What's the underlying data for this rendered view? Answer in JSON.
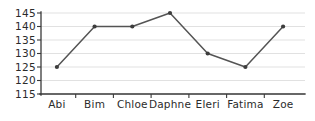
{
  "chart_data": {
    "type": "line",
    "title": "",
    "subtitle": "",
    "xlabel": "",
    "ylabel": "",
    "categories": [
      "Abi",
      "Bim",
      "Chloe",
      "Daphne",
      "Eleri",
      "Fatima",
      "Zoe"
    ],
    "values": [
      125,
      140,
      140,
      145,
      130,
      125,
      140
    ],
    "series": [
      {
        "name": "",
        "values": [
          125,
          140,
          140,
          145,
          130,
          125,
          140
        ]
      }
    ],
    "ylim": [
      115,
      145
    ],
    "ytick_values": [
      145,
      140,
      135,
      130,
      125,
      120,
      115
    ],
    "ytick_labels": [
      "145",
      "140",
      "135",
      "130",
      "125",
      "120",
      "115"
    ],
    "xtick_labels": [
      "Abi",
      "Bim",
      "Chloe",
      "Daphne",
      "Eleri",
      "Fatima",
      "Zoe"
    ],
    "grid": true,
    "grid_axis": "y",
    "legend": false,
    "legend_position": "none",
    "marker": "circle",
    "line_color": "#545454",
    "marker_color": "#3d3d3d",
    "grid_color": "#d9d9d9",
    "axis_color": "#3a3a3a",
    "text_color": "#2b2b2b",
    "background_color": "#ffffff",
    "annotations": []
  },
  "geometry": {
    "plot_left": 41,
    "plot_right": 305,
    "plot_top": 13,
    "plot_bottom": 94,
    "ytick_y": [
      13.0,
      26.5,
      40.0,
      53.5,
      67.0,
      80.5,
      94.0
    ],
    "point_x": [
      56.9,
      94.6,
      132.3,
      170.0,
      207.7,
      245.4,
      283.1
    ],
    "point_y": [
      67.0,
      26.5,
      26.5,
      13.0,
      53.5,
      67.0,
      26.5
    ],
    "xtick_boundary_x": [
      75.7,
      113.4,
      151.1,
      188.9,
      226.6,
      264.3
    ],
    "ytick_label_x": 36,
    "xtick_label_y": 108
  }
}
